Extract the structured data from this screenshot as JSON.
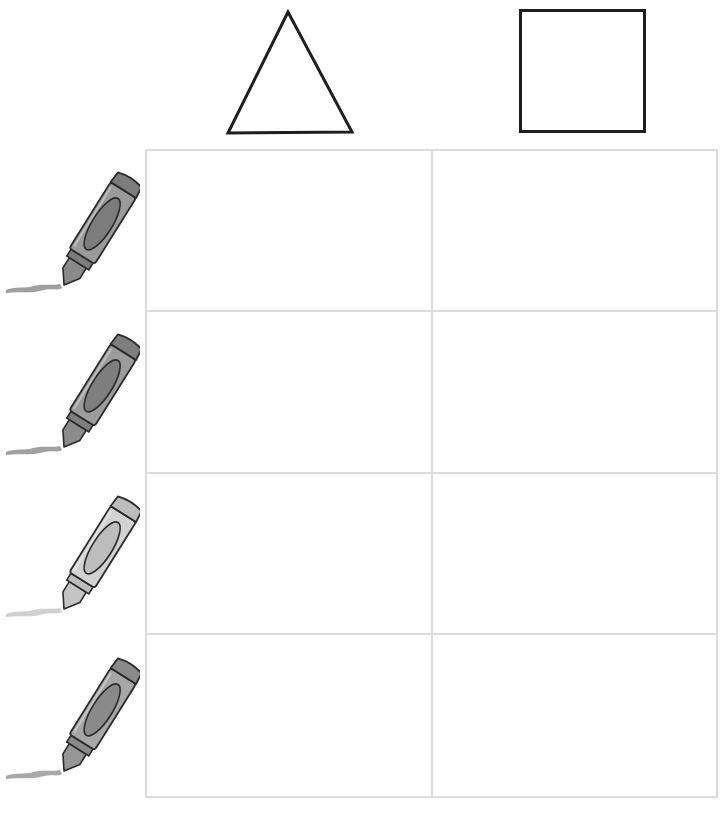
{
  "worksheet": {
    "columns": [
      {
        "shape": "triangle",
        "stroke": "#1e1e1e"
      },
      {
        "shape": "square",
        "stroke": "#1e1e1e"
      }
    ],
    "rows": [
      {
        "crayon": "dark-gray",
        "body": "#9a9a9a",
        "label": "#7c7c7c",
        "cap": "#8a8a8a",
        "mark": "#8e8e8e"
      },
      {
        "crayon": "dark-gray",
        "body": "#9c9c9c",
        "label": "#7e7e7e",
        "cap": "#8c8c8c",
        "mark": "#909090"
      },
      {
        "crayon": "light-gray",
        "body": "#d2d2d2",
        "label": "#bdbdbd",
        "cap": "#c4c4c4",
        "mark": "#c8c8c8"
      },
      {
        "crayon": "medium-gray",
        "body": "#a6a6a6",
        "label": "#8a8a8a",
        "cap": "#969696",
        "mark": "#9a9a9a"
      }
    ],
    "grid_line_color": "#dcdcdc"
  }
}
